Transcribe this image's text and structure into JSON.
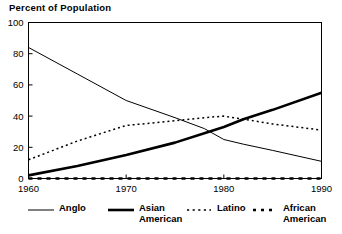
{
  "chart_data": {
    "type": "line",
    "title": "Percent of Population",
    "xlabel": "",
    "ylabel": "",
    "xlim": [
      1960,
      1990
    ],
    "ylim": [
      0,
      100
    ],
    "grid": false,
    "legend_position": "bottom",
    "x_ticks": [
      "1960",
      "1970",
      "1980",
      "1990"
    ],
    "x_tick_values": [
      1960,
      1970,
      1980,
      1990
    ],
    "y_ticks": [
      "0",
      "20",
      "40",
      "60",
      "80",
      "100"
    ],
    "y_tick_values": [
      0,
      20,
      40,
      60,
      80,
      100
    ],
    "x": [
      1960,
      1965,
      1970,
      1975,
      1978,
      1980,
      1982,
      1985,
      1990
    ],
    "series": [
      {
        "name": "Anglo",
        "style": "solid-thin",
        "color": "#000000",
        "values": [
          84,
          67,
          50,
          39,
          32,
          25,
          22,
          18,
          11
        ]
      },
      {
        "name": "Asian\nAmerican",
        "style": "solid-thick",
        "color": "#000000",
        "values": [
          2,
          8,
          15,
          23,
          29,
          33,
          38,
          44,
          55
        ]
      },
      {
        "name": "Latino",
        "style": "dotted",
        "color": "#000000",
        "values": [
          12,
          24,
          34,
          37,
          39,
          40,
          38,
          35,
          31
        ]
      },
      {
        "name": "African\nAmerican",
        "style": "dashed-thick",
        "color": "#000000",
        "values": [
          0,
          0,
          0,
          0,
          0,
          0,
          0,
          0,
          0
        ]
      }
    ]
  },
  "legend": {
    "items": [
      {
        "label": "Anglo",
        "style": "solid-thin"
      },
      {
        "label": "Asian\nAmerican",
        "style": "solid-thick"
      },
      {
        "label": "Latino",
        "style": "dotted"
      },
      {
        "label": "African\nAmerican",
        "style": "dashed-thick"
      }
    ]
  },
  "axes": {
    "frame_color": "#000000"
  }
}
